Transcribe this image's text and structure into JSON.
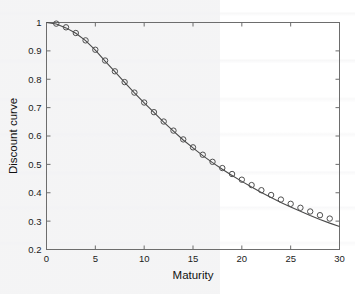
{
  "chart_data": {
    "type": "line",
    "title": "",
    "subtitle": "",
    "xlabel": "Maturity",
    "ylabel": "Discount curve",
    "xlim": [
      0,
      30
    ],
    "ylim": [
      0.2,
      1.0
    ],
    "xticks": [
      0,
      5,
      10,
      15,
      20,
      25,
      30
    ],
    "xticklabels": [
      "0",
      "5",
      "10",
      "15",
      "20",
      "25",
      "30"
    ],
    "yticks": [
      0.2,
      0.3,
      0.4,
      0.5,
      0.6,
      0.7,
      0.8,
      0.9,
      1.0
    ],
    "yticklabels": [
      "0.2",
      "0.3",
      "0.4",
      "0.5",
      "0.6",
      "0.7",
      "0.8",
      "0.9",
      "1"
    ],
    "grid": false,
    "legend": null,
    "box": true,
    "tick_direction": "in",
    "series": [
      {
        "name": "fitted discount curve",
        "style": "line",
        "color": "#4a4a4a",
        "x": [
          0,
          1,
          2,
          3,
          4,
          5,
          6,
          7,
          8,
          9,
          10,
          11,
          12,
          13,
          14,
          15,
          16,
          17,
          18,
          19,
          20,
          21,
          22,
          23,
          24,
          25,
          26,
          27,
          28,
          29,
          30
        ],
        "values": [
          1.0,
          0.995,
          0.981,
          0.962,
          0.936,
          0.903,
          0.864,
          0.827,
          0.789,
          0.752,
          0.717,
          0.683,
          0.649,
          0.617,
          0.586,
          0.558,
          0.531,
          0.506,
          0.483,
          0.461,
          0.44,
          0.42,
          0.401,
          0.383,
          0.366,
          0.35,
          0.335,
          0.32,
          0.306,
          0.293,
          0.281
        ]
      },
      {
        "name": "observed discount factors",
        "style": "markers",
        "marker": "circle-open",
        "color": "#4f4f4f",
        "x": [
          1,
          2,
          3,
          4,
          5,
          6,
          7,
          8,
          9,
          10,
          11,
          12,
          13,
          14,
          15,
          16,
          17,
          18,
          19,
          20,
          21,
          22,
          23,
          24,
          25,
          26,
          27,
          28,
          29
        ],
        "values": [
          0.996,
          0.983,
          0.963,
          0.937,
          0.904,
          0.866,
          0.828,
          0.79,
          0.753,
          0.718,
          0.684,
          0.651,
          0.619,
          0.588,
          0.56,
          0.534,
          0.509,
          0.487,
          0.466,
          0.446,
          0.427,
          0.409,
          0.392,
          0.376,
          0.361,
          0.347,
          0.334,
          0.321,
          0.309
        ]
      }
    ]
  },
  "colors": {
    "axis": "#6d6d6d",
    "line": "#4a4a4a",
    "marker": "#4f4f4f",
    "background": "#ffffff",
    "text": "#111111"
  }
}
